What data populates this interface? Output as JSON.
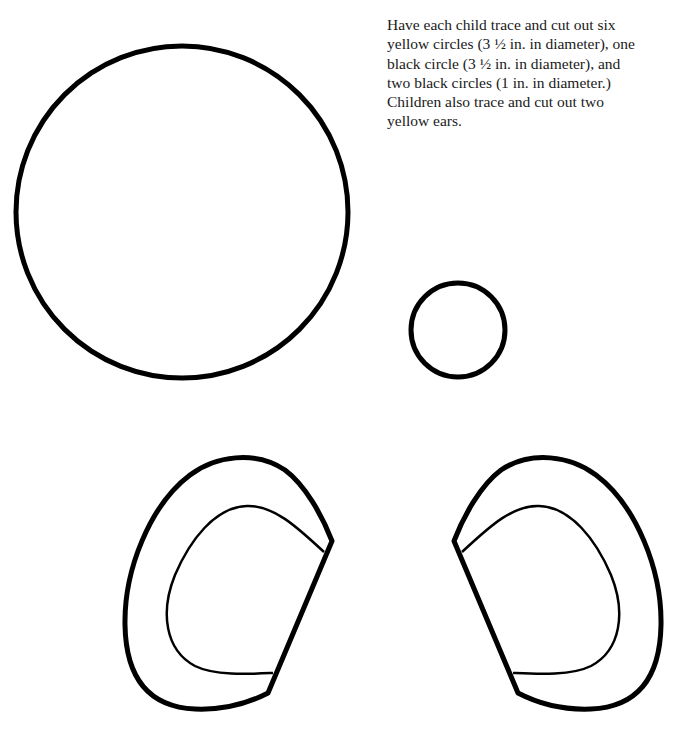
{
  "instructions": {
    "lines": [
      "Have each child trace and cut out six",
      "yellow circles (3 ½ in. in diameter), one",
      "black circle (3 ½ in. in diameter), and",
      "two black circles (1 in. in diameter.)",
      "Children also trace and cut out two",
      "yellow ears."
    ]
  },
  "shapes": {
    "large_circle": {
      "label": "3 1/2 in. circle template",
      "cx": 182,
      "cy": 212,
      "r": 166
    },
    "small_circle": {
      "label": "1 in. circle template",
      "cx": 458,
      "cy": 330,
      "r": 47
    },
    "left_ear": {
      "label": "left ear template"
    },
    "right_ear": {
      "label": "right ear template"
    }
  },
  "colors": {
    "stroke": "#000000",
    "background": "#ffffff",
    "text": "#1a1a1a"
  }
}
